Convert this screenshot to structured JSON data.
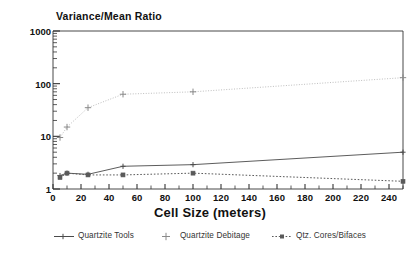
{
  "chart_data": {
    "type": "line",
    "title": "Variance/Mean Ratio",
    "xlabel": "Cell Size (meters)",
    "ylabel": "Variance/Mean Ratio",
    "yscale": "log",
    "xscale": "linear",
    "xlim": [
      0,
      250
    ],
    "ylim": [
      1,
      1000
    ],
    "grid": false,
    "legend_position": "bottom",
    "x_tick_labels": [
      "0",
      "20",
      "40",
      "60",
      "80",
      "100",
      "120",
      "140",
      "160",
      "180",
      "200",
      "220",
      "240"
    ],
    "x_tick_values": [
      0,
      20,
      40,
      60,
      80,
      100,
      120,
      140,
      160,
      180,
      200,
      220,
      240
    ],
    "x_minor_tick_step": 10,
    "y_tick_labels": [
      "1",
      "10",
      "100",
      "1000"
    ],
    "y_tick_values": [
      1,
      10,
      100,
      1000
    ],
    "x": [
      5,
      10,
      25,
      50,
      100,
      250
    ],
    "series": [
      {
        "name": "Quartzite Tools",
        "marker": "plus",
        "linestyle": "solid",
        "color": "#4a4a4a",
        "values": [
          1.8,
          2.0,
          1.9,
          2.7,
          2.9,
          5.0
        ]
      },
      {
        "name": "Quartzite Debitage",
        "marker": "plus",
        "linestyle": "dotted-light",
        "color": "#8a8a8a",
        "values": [
          9.5,
          15,
          35,
          63,
          70,
          130
        ]
      },
      {
        "name": "Qtz. Cores/Bifaces",
        "marker": "square",
        "linestyle": "dotted",
        "color": "#5a5a5a",
        "values": [
          1.65,
          2.0,
          1.85,
          1.85,
          2.0,
          1.4
        ]
      }
    ]
  },
  "legend": {
    "items": [
      {
        "label": "Quartzite Tools"
      },
      {
        "label": "Quartzite Debitage"
      },
      {
        "label": "Qtz. Cores/Bifaces"
      }
    ]
  },
  "colors": {
    "axis": "#333333",
    "background": "#ffffff",
    "text": "#111111"
  }
}
